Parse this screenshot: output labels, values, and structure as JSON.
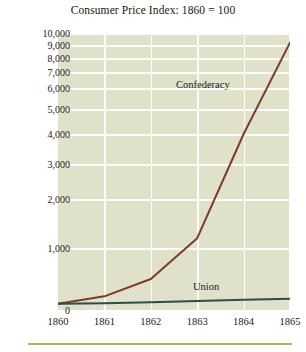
{
  "chart_data": {
    "type": "line",
    "title": "Consumer Price Index: 1860 = 100",
    "xlabel": "",
    "ylabel": "",
    "x": [
      1860,
      1861,
      1862,
      1863,
      1864,
      1865
    ],
    "xticklabels": [
      "1860",
      "1861",
      "1862",
      "1863",
      "1864",
      "1865"
    ],
    "yticks": [
      0,
      1000,
      2000,
      3000,
      4000,
      5000,
      6000,
      7000,
      8000,
      9000,
      10000
    ],
    "yticklabels": [
      "0",
      "1,000",
      "2,000",
      "3,000",
      "4,000",
      "5,000",
      "6,000",
      "7,000",
      "8,000",
      "9,000",
      "10,000"
    ],
    "ylim": [
      0,
      10000
    ],
    "xlim": [
      1860,
      1865
    ],
    "yscale": "compressed",
    "grid": true,
    "legend_position": "inline-annotations",
    "series": [
      {
        "name": "Confederacy",
        "color": "#7a3b28",
        "values": [
          100,
          220,
          500,
          1200,
          4000,
          9200
        ]
      },
      {
        "name": "Union",
        "color": "#2a4f4a",
        "values": [
          100,
          110,
          125,
          145,
          165,
          180
        ]
      }
    ],
    "annotations": [
      {
        "text": "Confederacy",
        "series": "Confederacy"
      },
      {
        "text": "Union",
        "series": "Union"
      }
    ],
    "colors": {
      "plot_background": "#dfe1cb",
      "gridline": "#fdfdf7",
      "page_background": "#ffffff",
      "rule": "#b2b25e",
      "text": "#1a1a18"
    }
  }
}
